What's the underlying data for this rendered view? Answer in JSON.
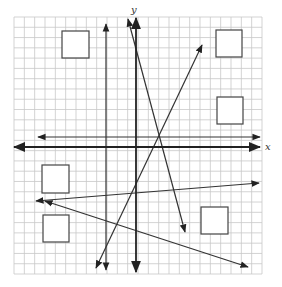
{
  "graph": {
    "axis_labels": {
      "x": "x",
      "y": "y"
    },
    "grid": {
      "left": 14,
      "top": 17,
      "right": 262,
      "bottom": 274,
      "cols": 24,
      "rows": 25
    },
    "colors": {
      "grid": "#c8c8c8",
      "axis": "#222222",
      "line": "#333333",
      "box": "#444444"
    },
    "axes": {
      "x_axis": {
        "x1": 14,
        "y1": 147,
        "x2": 260,
        "y2": 147
      },
      "y_axis": {
        "x1": 136,
        "y1": 18,
        "x2": 136,
        "y2": 272
      }
    },
    "lines": [
      {
        "id": "vertical-line",
        "x1": 106,
        "y1": 24,
        "x2": 106,
        "y2": 270,
        "arrows": "both"
      },
      {
        "id": "horizontal-line",
        "x1": 38,
        "y1": 137,
        "x2": 260,
        "y2": 137,
        "arrows": "both"
      },
      {
        "id": "steep-negative-line",
        "x1": 128,
        "y1": 19,
        "x2": 185,
        "y2": 232,
        "arrows": "both"
      },
      {
        "id": "positive-line",
        "x1": 96,
        "y1": 268,
        "x2": 202,
        "y2": 45,
        "arrows": "both"
      },
      {
        "id": "shallow-positive-line",
        "x1": 36,
        "y1": 201,
        "x2": 259,
        "y2": 183,
        "arrows": "both"
      },
      {
        "id": "shallow-negative-line",
        "x1": 45,
        "y1": 201,
        "x2": 248,
        "y2": 267,
        "arrows": "both"
      }
    ],
    "boxes": [
      {
        "id": "answer-box-1",
        "x": 62,
        "y": 31,
        "w": 27,
        "h": 27
      },
      {
        "id": "answer-box-2",
        "x": 216,
        "y": 30,
        "w": 26,
        "h": 27
      },
      {
        "id": "answer-box-3",
        "x": 217,
        "y": 97,
        "w": 26,
        "h": 27
      },
      {
        "id": "answer-box-4",
        "x": 42,
        "y": 165,
        "w": 27,
        "h": 28
      },
      {
        "id": "answer-box-5",
        "x": 43,
        "y": 215,
        "w": 26,
        "h": 27
      },
      {
        "id": "answer-box-6",
        "x": 201,
        "y": 207,
        "w": 27,
        "h": 27
      }
    ]
  }
}
